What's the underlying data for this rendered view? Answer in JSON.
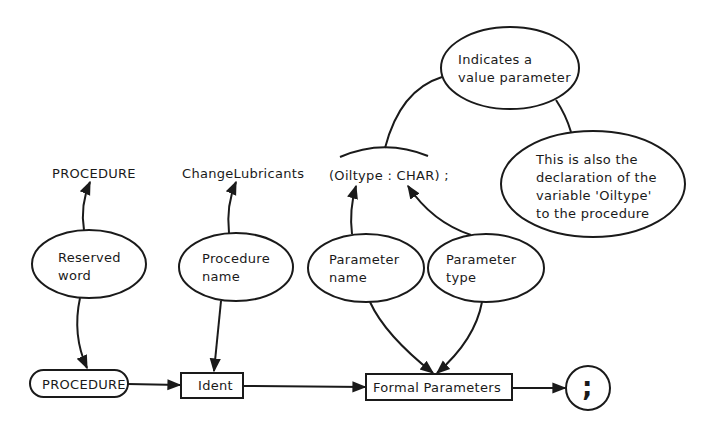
{
  "diagram": {
    "source_tokens": {
      "reserved": "PROCEDURE",
      "name": "ChangeLubricants",
      "params": "(Oiltype : CHAR) ;"
    },
    "annotations": {
      "reserved_word": {
        "line1": "Reserved",
        "line2": "word"
      },
      "procedure_name": {
        "line1": "Procedure",
        "line2": "name"
      },
      "parameter_name": {
        "line1": "Parameter",
        "line2": "name"
      },
      "parameter_type": {
        "line1": "Parameter",
        "line2": "type"
      },
      "value_parameter": {
        "line1": "Indicates a",
        "line2": "value parameter"
      },
      "declaration": {
        "line1": "This is also the",
        "line2": "declaration of the",
        "line3": "variable 'Oiltype'",
        "line4": "to the procedure"
      }
    },
    "syntax_flow": {
      "node1": "PROCEDURE",
      "node2": "Ident",
      "node3": "Formal Parameters",
      "node4": ";"
    },
    "colors": {
      "ink": "#1a1a1a",
      "background": "#ffffff"
    }
  }
}
